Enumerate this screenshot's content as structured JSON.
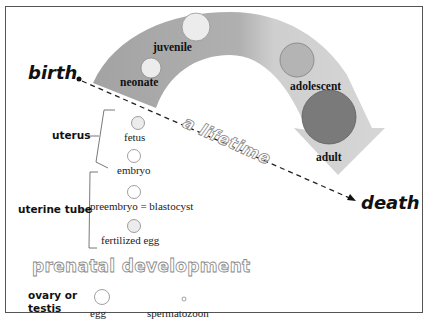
{
  "diagram": {
    "endpoints": {
      "start": "birth",
      "end": "death"
    },
    "axis_label": "a lifetime",
    "postnatal_stages": [
      {
        "label": "neonate"
      },
      {
        "label": "juvenile"
      },
      {
        "label": "adolescent"
      },
      {
        "label": "adult"
      }
    ],
    "prenatal_title": "prenatal development",
    "prenatal_locations": [
      {
        "label": "uterus"
      },
      {
        "label": "uterine tube"
      },
      {
        "label": "ovary or testis"
      }
    ],
    "prenatal_stages": [
      {
        "label": "fetus"
      },
      {
        "label": "embryo"
      },
      {
        "label": "preembryo = blastocyst"
      },
      {
        "label": "fertilized egg"
      }
    ],
    "gametes": [
      {
        "label": "egg"
      },
      {
        "label": "spermatozoon"
      }
    ],
    "colors": {
      "arrow_dark": "#a8a8a8",
      "arrow_light": "#d2d2d2",
      "circle_light": "#ececec",
      "circle_mid": "#b4b4b4",
      "circle_dark": "#7a7a7a",
      "frame": "#555555"
    }
  }
}
